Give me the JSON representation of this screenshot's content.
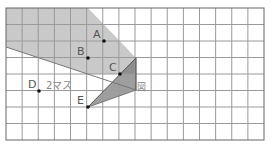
{
  "diagram": {
    "grid": {
      "cols": 16,
      "rows": 8,
      "left": 6,
      "top": 8,
      "cell_w": 16.125,
      "cell_h": 16.5,
      "line_color": "#9a9a9a",
      "border_color": "#666666"
    },
    "shapes": {
      "light_region_color": "#c9c9c9",
      "dark_region_color": "#9e9e9e"
    },
    "points": [
      {
        "label": "A",
        "x": 104,
        "y": 41
      },
      {
        "label": "B",
        "x": 88,
        "y": 58
      },
      {
        "label": "C",
        "x": 120,
        "y": 74
      },
      {
        "label": "D",
        "x": 39,
        "y": 91
      },
      {
        "label": "E",
        "x": 88,
        "y": 107
      }
    ],
    "annotations": {
      "two_squares": "2マス",
      "small_glyph": "図"
    }
  }
}
